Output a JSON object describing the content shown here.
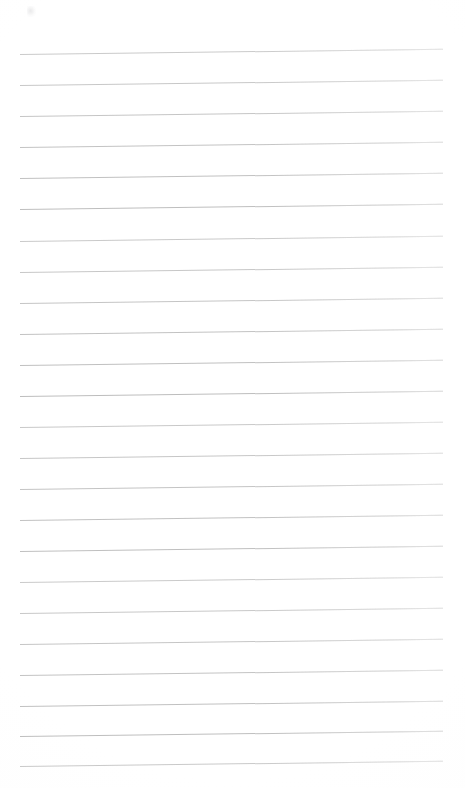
{
  "document": {
    "kind": "scanned-blank-lined-notebook-page",
    "title": "Blank lined paper",
    "page_width": 465,
    "page_height": 788,
    "background_color": "#ffffff",
    "has_text": false,
    "text_content": "",
    "visible_text_items": []
  },
  "ruling": {
    "line_color": "#bdbdbd",
    "line_thickness_px": 1,
    "line_count": 24,
    "line_spacing_px": 31.3,
    "first_line_y": 54,
    "last_line_y": 766,
    "left_x": 20,
    "right_x": 443,
    "line_length_px": 423,
    "skew_degrees": -0.7,
    "style": "horizontal-rules-only",
    "margin_rule": "none",
    "line_y_positions": [
      54,
      85,
      116,
      147,
      178,
      209,
      241,
      272,
      303,
      334,
      365,
      396,
      427,
      458,
      489,
      520,
      551,
      582,
      613,
      644,
      675,
      706,
      736,
      766
    ]
  },
  "artifacts": {
    "smudge": {
      "label": "faint-scan-speck",
      "x": 27,
      "y": 6,
      "color": "#9a9a9f"
    }
  }
}
